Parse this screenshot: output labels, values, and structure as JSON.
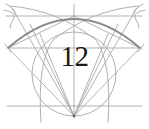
{
  "diagram": {
    "type": "geometric-construction",
    "figure_number": "12",
    "colors": {
      "background": "#ffffff",
      "construction_line": "#a8a8a8",
      "heavy_arc": "#8a8a8a",
      "label": "#1a1a1a",
      "apex_point": "#555555"
    },
    "elements": {
      "circle": {
        "cx": 74,
        "cy": 74,
        "r": 42
      },
      "heavy_arc": {
        "from": [
          8,
          48
        ],
        "through": [
          74,
          18
        ],
        "to": [
          140,
          48
        ]
      },
      "horizontal_lines_y": [
        16,
        48,
        106
      ],
      "vertical_center_x": 74,
      "apex": [
        74,
        116
      ],
      "left_point": [
        8,
        48
      ],
      "right_point": [
        140,
        48
      ]
    }
  }
}
